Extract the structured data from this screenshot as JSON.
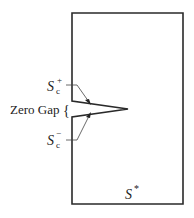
{
  "diagram": {
    "labels": {
      "s_plus_main": "S",
      "s_plus_sub": "c",
      "s_plus_sup": "+",
      "s_minus_main": "S",
      "s_minus_sub": "c",
      "s_minus_sup": "−",
      "zero_gap": "Zero Gap",
      "brace": "{",
      "s_star_main": "S",
      "s_star_sup": "*"
    },
    "colors": {
      "stroke": "#2a2a2a",
      "background": "#ffffff"
    }
  }
}
